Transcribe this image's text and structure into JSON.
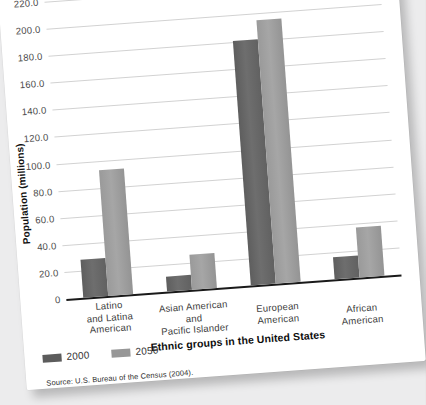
{
  "figure": {
    "source_note": "Source: U.S. Bureau of the Census (2004).",
    "background_color": "#ececed",
    "card_color": "#ffffff"
  },
  "chart_data": {
    "type": "bar",
    "title": "",
    "xlabel": "Ethnic groups in the United States",
    "ylabel": "Population (millions)",
    "ylim": [
      0,
      220
    ],
    "ytick_step": 20,
    "grid": true,
    "legend_position": "bottom-left",
    "categories": [
      "Latino and Latina American",
      "Asian American and Pacific Islander",
      "European American",
      "African American"
    ],
    "category_lines": [
      [
        "Latino",
        "and Latina",
        "American"
      ],
      [
        "Asian American",
        "and",
        "Pacific Islander"
      ],
      [
        "European",
        "American"
      ],
      [
        "African",
        "American"
      ]
    ],
    "ytick_labels": [
      "220.0",
      "200.0",
      "180.0",
      "160.0",
      "140.0",
      "120.0",
      "100.0",
      "80.0",
      "60.0",
      "40.0",
      "20.0",
      "0"
    ],
    "ytick_values": [
      220,
      200,
      180,
      160,
      140,
      120,
      100,
      80,
      60,
      40,
      20,
      0
    ],
    "series": [
      {
        "name": "2000",
        "color": "#6b6b6b",
        "values": [
          28,
          11,
          181,
          16
        ]
      },
      {
        "name": "2050",
        "color": "#9d9d9d",
        "values": [
          93,
          26,
          195,
          37
        ]
      }
    ]
  }
}
